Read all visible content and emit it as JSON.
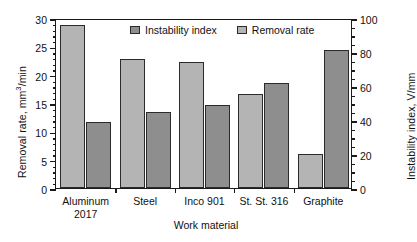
{
  "chart_data": {
    "type": "bar",
    "title": "",
    "categories": [
      "Aluminum\n2017",
      "Steel",
      "Inco 901",
      "St. St. 316",
      "Graphite"
    ],
    "series": [
      {
        "name": "Removal rate",
        "axis": "left",
        "color": "#b4b4b4",
        "unit": "mm3/min",
        "values": [
          28.8,
          22.8,
          22.2,
          16.6,
          6.0
        ]
      },
      {
        "name": "Instability index",
        "axis": "right",
        "color": "#8e8e8e",
        "unit": "V/mm",
        "values": [
          39,
          45,
          49,
          62,
          81
        ]
      }
    ],
    "xlabel": "Work material",
    "ylabel": "Removal rate, mm3/min",
    "ylabel_right": "Instability index, V/mm",
    "ylim": [
      0,
      30
    ],
    "ylim_right": [
      0,
      100
    ],
    "yticks": [
      0,
      5,
      10,
      15,
      20,
      25,
      30
    ],
    "yticks_right": [
      0,
      20,
      40,
      60,
      80,
      100
    ],
    "grid": false,
    "legend_position": "top-center",
    "legend_entries": [
      "Instability index",
      "Removal rate"
    ]
  },
  "axes": {
    "left_title_main": "Removal rate, mm",
    "left_title_sup": "3",
    "left_title_tail": "/min",
    "right_title": "Instability index, V/mm",
    "x_title": "Work material"
  },
  "legend": {
    "items": [
      {
        "label": "Instability index"
      },
      {
        "label": "Removal rate"
      }
    ]
  }
}
